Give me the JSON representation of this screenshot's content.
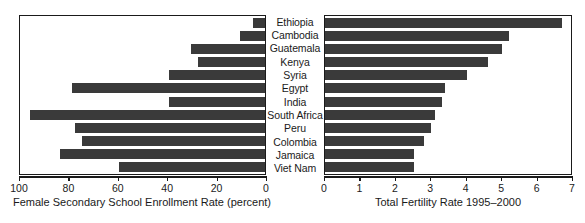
{
  "chart_data": {
    "type": "bar",
    "orientation": "horizontal",
    "layout": "paired-back-to-back",
    "title": "",
    "categories": [
      "Ethiopia",
      "Cambodia",
      "Guatemala",
      "Kenya",
      "Syria",
      "Egypt",
      "India",
      "South Africa",
      "Peru",
      "Colombia",
      "Jamaica",
      "Viet Nam"
    ],
    "grid": false,
    "legend": "none",
    "panels": [
      {
        "name": "left",
        "xlabel": "Female Secondary School Enrollment Rate (percent)",
        "ylabel": "",
        "direction": "right-to-left",
        "xlim": [
          100,
          0
        ],
        "ticks": [
          100,
          80,
          60,
          40,
          20,
          0
        ],
        "tick_labels": [
          "100",
          "80",
          "60",
          "40",
          "20",
          "0"
        ],
        "values": [
          5,
          10,
          30,
          27,
          39,
          78,
          39,
          95,
          77,
          74,
          83,
          59
        ]
      },
      {
        "name": "right",
        "xlabel": "Total Fertility Rate 1995–2000",
        "ylabel": "",
        "direction": "left-to-right",
        "xlim": [
          0,
          7
        ],
        "ticks": [
          0,
          1,
          2,
          3,
          4,
          5,
          6,
          7
        ],
        "tick_labels": [
          "0",
          "1",
          "2",
          "3",
          "4",
          "5",
          "6",
          "7"
        ],
        "values": [
          6.7,
          5.2,
          5.0,
          4.6,
          4.0,
          3.4,
          3.3,
          3.1,
          3.0,
          2.8,
          2.5,
          2.5
        ]
      }
    ],
    "colors": {
      "bar": "#3a3a3a",
      "axis": "#1a1a1a",
      "background": "#ffffff"
    }
  }
}
